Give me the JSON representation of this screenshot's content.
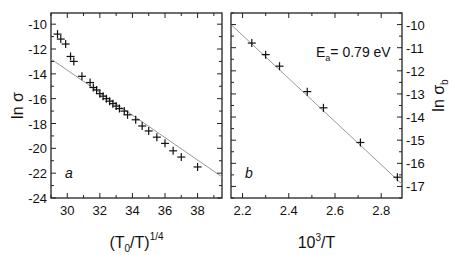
{
  "chart_data": [
    {
      "type": "scatter",
      "panel_label": "a",
      "xlabel": "(T0/T)^1/4",
      "xlabel_parts": {
        "open": "(T",
        "sub": "0",
        "mid": "/T)",
        "sup": "1/4"
      },
      "ylabel": "ln σ",
      "xlim": [
        29.0,
        39.5
      ],
      "ylim": [
        -24,
        -9.1
      ],
      "xticks": [
        30,
        32,
        34,
        36,
        38
      ],
      "yticks": [
        -10,
        -12,
        -14,
        -16,
        -18,
        -20,
        -22,
        -24
      ],
      "grid": false,
      "marker": "+",
      "series": [
        {
          "name": "data",
          "x": [
            29.4,
            29.6,
            29.9,
            30.2,
            30.4,
            30.9,
            31.4,
            31.6,
            31.8,
            32.0,
            32.2,
            32.4,
            32.6,
            32.8,
            33.0,
            33.2,
            33.5,
            33.7,
            34.2,
            34.6,
            35.0,
            35.5,
            36.0,
            36.5,
            37.0,
            38.0
          ],
          "y": [
            -10.8,
            -11.2,
            -11.6,
            -12.6,
            -13.0,
            -14.2,
            -14.7,
            -15.1,
            -15.3,
            -15.6,
            -15.8,
            -16.0,
            -16.2,
            -16.4,
            -16.6,
            -16.8,
            -17.0,
            -17.3,
            -17.7,
            -18.2,
            -18.6,
            -19.1,
            -19.6,
            -20.2,
            -20.7,
            -21.5
          ]
        },
        {
          "name": "fit line",
          "type": "line",
          "x": [
            29.0,
            39.5
          ],
          "y": [
            -12.8,
            -22.3
          ]
        }
      ]
    },
    {
      "type": "scatter",
      "panel_label": "b",
      "xlabel": "10^3/T",
      "xlabel_parts": {
        "base": "10",
        "sup": "3",
        "rest": "/T"
      },
      "ylabel": "ln σb",
      "ylabel_parts": {
        "main": "ln σ",
        "sub": "b"
      },
      "ylabel_position": "right",
      "xlim": [
        2.15,
        2.89
      ],
      "ylim": [
        -17.5,
        -9.5
      ],
      "xticks": [
        2.2,
        2.4,
        2.6,
        2.8
      ],
      "yticks": [
        -10,
        -11,
        -12,
        -13,
        -14,
        -15,
        -16,
        -17
      ],
      "grid": false,
      "marker": "+",
      "annotation": {
        "text": "Ea= 0.79 eV",
        "main": "E",
        "sub": "a",
        "rest": "= 0.79 eV"
      },
      "series": [
        {
          "name": "data",
          "x": [
            2.24,
            2.3,
            2.36,
            2.48,
            2.55,
            2.71,
            2.87
          ],
          "y": [
            -10.8,
            -11.3,
            -11.8,
            -12.9,
            -13.6,
            -15.1,
            -16.6
          ]
        },
        {
          "name": "fit line",
          "type": "line",
          "x": [
            2.15,
            2.89
          ],
          "y": [
            -10.0,
            -16.9
          ]
        }
      ]
    }
  ]
}
